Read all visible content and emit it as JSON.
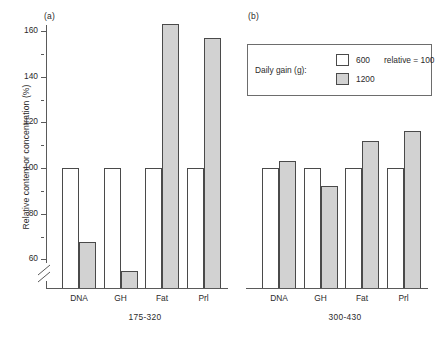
{
  "figure": {
    "ylabel": "Relative content or concentration (%)",
    "panel_a_tag": "(a)",
    "panel_b_tag": "(b)"
  },
  "legend": {
    "title": "Daily gain (g):",
    "entry_600": "600",
    "relative_note": "relative = 100",
    "entry_1200": "1200",
    "swatch_600_color": "#ffffff",
    "swatch_1200_color": "#d2d2d2"
  },
  "axis": {
    "ticks": [
      "60",
      "80",
      "100",
      "120",
      "140",
      "160"
    ],
    "break_below": "60"
  },
  "panels": {
    "a": {
      "caption": "175-320",
      "groups": [
        "DNA",
        "GH",
        "Fat",
        "Prl"
      ]
    },
    "b": {
      "caption": "300-430",
      "groups": [
        "DNA",
        "GH",
        "Fat",
        "Prl"
      ]
    }
  },
  "chart_data": {
    "type": "bar",
    "title": "",
    "xlabel": "",
    "ylabel": "Relative content or concentration (%)",
    "ylim": [
      52,
      168
    ],
    "yticks": [
      60,
      80,
      100,
      120,
      140,
      160
    ],
    "axis_break": "y-axis broken below 60",
    "grid": false,
    "legend_position": "top-right (inside panel b)",
    "panels": [
      {
        "label": "(a)",
        "caption": "175-320",
        "categories": [
          "DNA",
          "GH",
          "Fat",
          "Prl"
        ],
        "series": [
          {
            "name": "600",
            "values": [
              100,
              100,
              100,
              100
            ]
          },
          {
            "name": "1200",
            "values": [
              67.5,
              55,
              163,
              157
            ]
          }
        ]
      },
      {
        "label": "(b)",
        "caption": "300-430",
        "categories": [
          "DNA",
          "GH",
          "Fat",
          "Prl"
        ],
        "series": [
          {
            "name": "600",
            "values": [
              100,
              100,
              100,
              100
            ]
          },
          {
            "name": "1200",
            "values": [
              103,
              92,
              112,
              116
            ]
          }
        ]
      }
    ]
  }
}
